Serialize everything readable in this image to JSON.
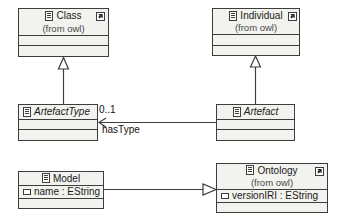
{
  "diagram": {
    "type": "uml-class-diagram",
    "background": "#ffffff",
    "box_fill": "#f2f2ee",
    "line_color": "#3d3d3d",
    "classes": [
      {
        "id": "class",
        "name": "Class",
        "stereotype_from": "(from owl)",
        "abstract": false,
        "has_badge": true,
        "attributes": [],
        "empty_compartments": 2
      },
      {
        "id": "individual",
        "name": "Individual",
        "stereotype_from": "(from owl)",
        "abstract": false,
        "has_badge": true,
        "attributes": [],
        "empty_compartments": 2
      },
      {
        "id": "artefacttype",
        "name": "ArtefactType",
        "stereotype_from": "",
        "abstract": true,
        "has_badge": false,
        "attributes": [],
        "empty_compartments": 2
      },
      {
        "id": "artefact",
        "name": "Artefact",
        "stereotype_from": "",
        "abstract": true,
        "has_badge": false,
        "attributes": [],
        "empty_compartments": 2
      },
      {
        "id": "model",
        "name": "Model",
        "stereotype_from": "",
        "abstract": false,
        "has_badge": false,
        "attributes": [
          "name : EString"
        ],
        "empty_compartments": 1
      },
      {
        "id": "ontology",
        "name": "Ontology",
        "stereotype_from": "(from owl)",
        "abstract": false,
        "has_badge": true,
        "attributes": [
          "versionIRI : EString"
        ],
        "empty_compartments": 1
      }
    ],
    "relations": [
      {
        "id": "artefacttype-to-class",
        "kind": "generalization",
        "source": "artefacttype",
        "target": "class",
        "label": "",
        "multiplicity": ""
      },
      {
        "id": "artefact-to-individual",
        "kind": "generalization",
        "source": "artefact",
        "target": "individual",
        "label": "",
        "multiplicity": ""
      },
      {
        "id": "artefact-hastype-artefacttype",
        "kind": "association",
        "source": "artefact",
        "target": "artefacttype",
        "label": "hasType",
        "multiplicity": "0..1"
      },
      {
        "id": "model-to-ontology",
        "kind": "generalization",
        "source": "model",
        "target": "ontology",
        "label": "",
        "multiplicity": ""
      }
    ],
    "labels": {
      "multiplicity_0_1": "0..1",
      "hastype": "hasType"
    }
  }
}
